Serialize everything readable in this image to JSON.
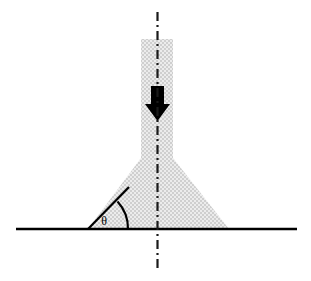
{
  "figure": {
    "name": "loaded-wedge-foundation-diagram",
    "background_color": "#ffffff",
    "canvas": {
      "width": 311,
      "height": 281
    }
  },
  "labels": {
    "angle_symbol": "θ"
  },
  "colors": {
    "shading_fill": "#dcdcdc",
    "shading_fill_light": "#e6e6e6",
    "line": "#000000",
    "arrow": "#000000",
    "centerline": "#1a1a1a"
  },
  "geometry": {
    "ground_line": {
      "name": "ground-line",
      "x1": 16,
      "y1": 229,
      "x2": 297,
      "y2": 229,
      "stroke_width": 2.6
    },
    "centerline": {
      "name": "axis-of-symmetry",
      "x": 157,
      "y_top": 12,
      "y_bottom": 268,
      "stroke_width": 2.2,
      "dash_pattern": "9 4 2 4"
    },
    "column": {
      "name": "vertical-column",
      "left": 141,
      "right": 173,
      "top": 39,
      "bottom": 158,
      "width": 32,
      "height": 119
    },
    "wedge": {
      "name": "triangular-wedge",
      "apex_left_x": 141,
      "apex_right_x": 173,
      "apex_y": 158,
      "base_left_x": 88,
      "base_right_x": 229,
      "base_y": 229
    },
    "load_arrow": {
      "name": "downward-load-arrow",
      "shaft_left": 151,
      "shaft_right": 164,
      "shaft_top": 86,
      "shaft_bottom": 104,
      "head_left": 145,
      "head_right": 170,
      "head_top": 104,
      "head_tip_y": 121,
      "direction": "down"
    },
    "angle_marker": {
      "name": "base-angle-marker",
      "vertex_x": 88,
      "vertex_y": 229,
      "ray_end_x": 128,
      "ray_end_y": 188,
      "arc_radius": 40,
      "arc_start_x": 128,
      "arc_start_y": 229,
      "arc_end_x": 118,
      "arc_end_y": 199,
      "label_x": 104,
      "label_y": 223,
      "degrees_approx": 46
    }
  }
}
